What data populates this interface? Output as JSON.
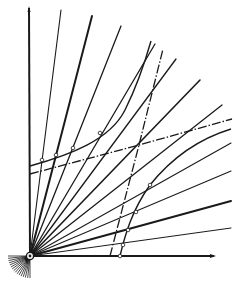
{
  "figure": {
    "type": "geometric construction diagram",
    "background": "#ffffff",
    "ink": "#1a1a1a",
    "origin": [
      30,
      256
    ],
    "axes": {
      "y_axis": {
        "from": [
          30,
          256
        ],
        "to": [
          29,
          8
        ]
      },
      "x_axis": {
        "from": [
          30,
          256
        ],
        "to": [
          214,
          256
        ],
        "arrowhead": true
      }
    },
    "rays": [
      {
        "to": [
          61,
          10
        ],
        "weight": 1.1
      },
      {
        "to": [
          92,
          16
        ],
        "weight": 2.0
      },
      {
        "to": [
          121,
          26
        ],
        "weight": 1.3
      },
      {
        "to": [
          155,
          44
        ],
        "weight": 1.3
      },
      {
        "to": [
          176,
          59
        ],
        "weight": 1.3
      },
      {
        "to": [
          200,
          80
        ],
        "weight": 1.6
      },
      {
        "to": [
          222,
          105
        ],
        "weight": 1.3
      },
      {
        "to": [
          231,
          143
        ],
        "weight": 1.1
      },
      {
        "to": [
          231,
          171
        ],
        "weight": 1.1
      },
      {
        "to": [
          231,
          201
        ],
        "weight": 2.0
      },
      {
        "to": [
          231,
          228
        ],
        "weight": 1.0
      }
    ],
    "dashed_lines": [
      {
        "points": [
          [
            30,
            174
          ],
          [
            139,
            145
          ],
          [
            232,
            119
          ]
        ],
        "style": "dot-dash"
      },
      {
        "points": [
          [
            110,
            256
          ],
          [
            139,
            145
          ],
          [
            163,
            49
          ]
        ],
        "style": "dot-dash"
      }
    ],
    "curves": [
      {
        "path": "M30,166 C70,155 110,140 125,110 C135,90 145,62 151,41",
        "weight": 1.4
      },
      {
        "path": "M120,256 C125,235 132,210 150,185 C170,160 195,140 231,129",
        "weight": 1.4
      }
    ],
    "markers": [
      [
        42,
        160
      ],
      [
        56,
        155
      ],
      [
        73,
        148
      ],
      [
        100,
        133
      ],
      [
        150,
        185
      ],
      [
        136,
        212
      ],
      [
        128,
        230
      ],
      [
        123,
        245
      ],
      [
        120,
        256
      ]
    ],
    "small_fan": {
      "center": [
        30,
        256
      ],
      "radius": 22,
      "angle_start_deg": 180,
      "angle_end_deg": 270,
      "count": 16
    }
  }
}
